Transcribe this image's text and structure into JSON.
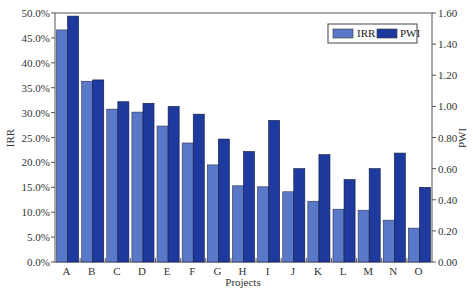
{
  "chart_data": {
    "type": "bar",
    "title": "",
    "xlabel": "Projects",
    "ylabel": "IRR",
    "y2label": "PWI",
    "categories": [
      "A",
      "B",
      "C",
      "D",
      "E",
      "F",
      "G",
      "H",
      "I",
      "J",
      "K",
      "L",
      "M",
      "N",
      "O"
    ],
    "series": [
      {
        "name": "IRR",
        "axis": "left",
        "color": "#5a78c8",
        "values": [
          46.6,
          36.3,
          30.7,
          30.1,
          27.3,
          23.9,
          19.5,
          15.3,
          15.1,
          14.1,
          12.2,
          10.6,
          10.4,
          8.4,
          6.8
        ]
      },
      {
        "name": "PWI",
        "axis": "right",
        "color": "#1f3a9e",
        "values": [
          1.58,
          1.17,
          1.03,
          1.02,
          1.0,
          0.95,
          0.79,
          0.71,
          0.91,
          0.6,
          0.69,
          0.53,
          0.6,
          0.7,
          0.48
        ]
      }
    ],
    "ylim": [
      0,
      50
    ],
    "y2lim": [
      0,
      1.6
    ],
    "yticks": [
      "0.0%",
      "5.0%",
      "10.0%",
      "15.0%",
      "20.0%",
      "25.0%",
      "30.0%",
      "35.0%",
      "40.0%",
      "45.0%",
      "50.0%"
    ],
    "y2ticks": [
      "0.00",
      "0.20",
      "0.40",
      "0.60",
      "0.80",
      "1.00",
      "1.20",
      "1.40",
      "1.60"
    ],
    "grid": false,
    "legend_position": "top-right"
  },
  "legend": {
    "items": [
      {
        "label": "IRR",
        "color": "#5a78c8"
      },
      {
        "label": "PWI",
        "color": "#1f3a9e"
      }
    ]
  }
}
